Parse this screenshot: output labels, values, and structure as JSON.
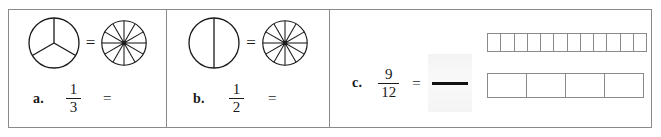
{
  "worksheet": {
    "items": [
      {
        "letter": "a.",
        "numerator": "1",
        "denominator": "3",
        "equals": "=",
        "model_equals": "=",
        "left_model": {
          "type": "pie",
          "sectors": 3
        },
        "right_model": {
          "type": "pie",
          "sectors": 12
        }
      },
      {
        "letter": "b.",
        "numerator": "1",
        "denominator": "2",
        "equals": "=",
        "model_equals": "=",
        "left_model": {
          "type": "pie",
          "sectors": 2
        },
        "right_model": {
          "type": "pie",
          "sectors": 12
        }
      },
      {
        "letter": "c.",
        "numerator": "9",
        "denominator": "12",
        "equals": "=",
        "answer_numerator": "",
        "answer_denominator": "",
        "top_bar": {
          "type": "bar",
          "cells": 12
        },
        "bottom_bar": {
          "type": "bar",
          "cells": 4
        }
      }
    ]
  },
  "colors": {
    "ink": "#1a1a1a",
    "rule": "#8a8a8a",
    "blank_fill": "#ededed",
    "page": "#ffffff"
  }
}
